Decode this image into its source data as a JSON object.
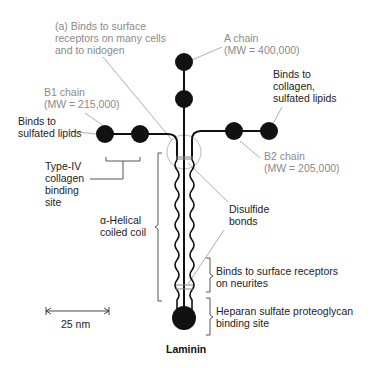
{
  "figure": {
    "panel_label": "(a)",
    "title": "Laminin",
    "colors": {
      "structure": "#111111",
      "gray_label": "#8a8a8a",
      "dark_label": "#222222",
      "leader_line": "#999999"
    }
  },
  "labels": {
    "top_binding": "(a) Binds to surface\nreceptors on many cells\nand to nidogen",
    "a_chain": "A chain\n(MW = 400,000)",
    "b1_chain": "B1 chain\n(MW = 215,000)",
    "b2_chain": "B2 chain\n(MW = 205,000)",
    "binds_collagen_lipids": "Binds to\ncollagen,\nsulfated lipids",
    "binds_sulfated_lipids": "Binds to\nsulfated lipids",
    "type_iv_collagen": "Type-IV\ncollagen\nbinding\nsite",
    "alpha_helical": "α-Helical\ncoiled coil",
    "disulfide": "Disulfide\nbonds",
    "neurites": "Binds to surface receptors\non neurites",
    "heparan": "Heparan sulfate proteoglycan\nbinding site",
    "scale_bar": "25 nm"
  }
}
